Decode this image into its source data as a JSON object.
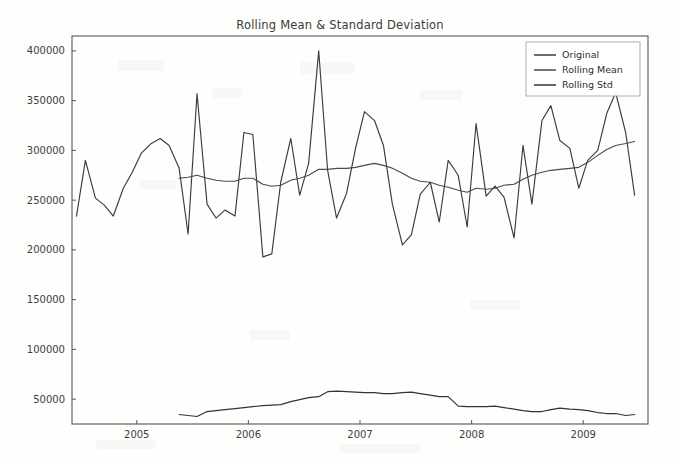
{
  "chart_data": {
    "type": "line",
    "title": "Rolling Mean & Standard Deviation",
    "xlabel": "",
    "ylabel": "",
    "grid": false,
    "legend_position": "upper right",
    "xlim": [
      2004.42,
      2009.58
    ],
    "ylim": [
      25000,
      415000
    ],
    "xticks": [
      2005,
      2006,
      2007,
      2008,
      2009
    ],
    "xtick_labels": [
      "2005",
      "2006",
      "2007",
      "2008",
      "2009"
    ],
    "yticks": [
      50000,
      100000,
      150000,
      200000,
      250000,
      300000,
      350000,
      400000
    ],
    "ytick_labels": [
      "50000",
      "100000",
      "150000",
      "200000",
      "250000",
      "300000",
      "350000",
      "400000"
    ],
    "series": [
      {
        "name": "Original",
        "color": "#3b3b3b",
        "x": [
          2004.46,
          2004.54,
          2004.63,
          2004.71,
          2004.79,
          2004.88,
          2004.96,
          2005.04,
          2005.13,
          2005.21,
          2005.29,
          2005.38,
          2005.46,
          2005.54,
          2005.63,
          2005.71,
          2005.79,
          2005.88,
          2005.96,
          2006.04,
          2006.13,
          2006.21,
          2006.29,
          2006.38,
          2006.46,
          2006.54,
          2006.63,
          2006.71,
          2006.79,
          2006.88,
          2006.96,
          2007.04,
          2007.13,
          2007.21,
          2007.29,
          2007.38,
          2007.46,
          2007.54,
          2007.63,
          2007.71,
          2007.79,
          2007.88,
          2007.96,
          2008.04,
          2008.13,
          2008.21,
          2008.29,
          2008.38,
          2008.46,
          2008.54,
          2008.63,
          2008.71,
          2008.79,
          2008.88,
          2008.96,
          2009.04,
          2009.13,
          2009.21,
          2009.29,
          2009.38,
          2009.46
        ],
        "y": [
          234000,
          290000,
          252000,
          245000,
          234000,
          262000,
          278000,
          297000,
          307000,
          312000,
          305000,
          282000,
          216000,
          357000,
          246000,
          232000,
          240000,
          234000,
          318000,
          316000,
          193000,
          196000,
          268000,
          312000,
          255000,
          287000,
          400000,
          280000,
          232000,
          257000,
          302000,
          339000,
          330000,
          305000,
          246000,
          205000,
          215000,
          256000,
          268000,
          228000,
          290000,
          275000,
          223000,
          327000,
          254000,
          264000,
          253000,
          212000,
          305000,
          246000,
          330000,
          345000,
          310000,
          302000,
          262000,
          290000,
          300000,
          337000,
          358000,
          318000,
          255000
        ]
      },
      {
        "name": "Rolling Mean",
        "color": "#4a4a4a",
        "x": [
          2005.38,
          2005.46,
          2005.54,
          2005.63,
          2005.71,
          2005.79,
          2005.88,
          2005.96,
          2006.04,
          2006.13,
          2006.21,
          2006.29,
          2006.38,
          2006.46,
          2006.54,
          2006.63,
          2006.71,
          2006.79,
          2006.88,
          2006.96,
          2007.04,
          2007.13,
          2007.21,
          2007.29,
          2007.38,
          2007.46,
          2007.54,
          2007.63,
          2007.71,
          2007.79,
          2007.88,
          2007.96,
          2008.04,
          2008.13,
          2008.21,
          2008.29,
          2008.38,
          2008.46,
          2008.54,
          2008.63,
          2008.71,
          2008.79,
          2008.88,
          2008.96,
          2009.04,
          2009.13,
          2009.21,
          2009.29,
          2009.38,
          2009.46
        ],
        "y": [
          272000,
          273000,
          275000,
          272000,
          270000,
          269000,
          269000,
          272000,
          272000,
          266000,
          264000,
          265000,
          270000,
          272000,
          275000,
          281000,
          281000,
          282000,
          282000,
          283000,
          285000,
          287000,
          285000,
          282000,
          277000,
          272000,
          269000,
          268000,
          265000,
          263000,
          260000,
          258000,
          262000,
          261000,
          262000,
          265000,
          266000,
          271000,
          275000,
          278000,
          280000,
          281000,
          282000,
          283000,
          288000,
          295000,
          301000,
          305000,
          307000,
          309000
        ]
      },
      {
        "name": "Rolling Std",
        "color": "#333333",
        "x": [
          2005.38,
          2005.46,
          2005.54,
          2005.63,
          2005.71,
          2005.79,
          2005.88,
          2005.96,
          2006.04,
          2006.13,
          2006.21,
          2006.29,
          2006.38,
          2006.46,
          2006.54,
          2006.63,
          2006.71,
          2006.79,
          2006.88,
          2006.96,
          2007.04,
          2007.13,
          2007.21,
          2007.29,
          2007.38,
          2007.46,
          2007.54,
          2007.63,
          2007.71,
          2007.79,
          2007.88,
          2007.96,
          2008.04,
          2008.13,
          2008.21,
          2008.29,
          2008.38,
          2008.46,
          2008.54,
          2008.63,
          2008.71,
          2008.79,
          2008.88,
          2008.96,
          2009.04,
          2009.13,
          2009.21,
          2009.29,
          2009.38,
          2009.46
        ],
        "y": [
          34500,
          33500,
          32500,
          37500,
          38500,
          39500,
          40500,
          41500,
          42500,
          43500,
          44000,
          44500,
          47500,
          49500,
          51500,
          52500,
          57500,
          58000,
          57500,
          57000,
          56500,
          56500,
          55500,
          55500,
          56500,
          57000,
          55500,
          54000,
          52500,
          52500,
          43000,
          42500,
          42500,
          42500,
          43000,
          41500,
          40000,
          38500,
          37500,
          37500,
          39500,
          41000,
          40000,
          39500,
          38500,
          36500,
          35500,
          35500,
          33500,
          34500
        ]
      }
    ]
  },
  "legend": {
    "items": [
      {
        "label": "Original"
      },
      {
        "label": "Rolling Mean"
      },
      {
        "label": "Rolling Std"
      }
    ]
  },
  "axes": {
    "frame_color": "#555555"
  }
}
